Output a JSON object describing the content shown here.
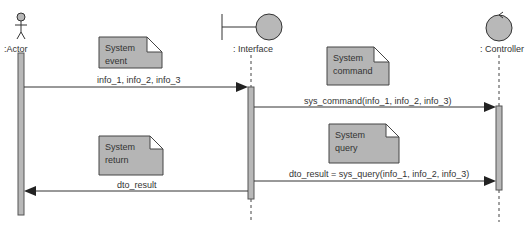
{
  "diagram": {
    "type": "sequence",
    "lifelines": [
      {
        "name": ":Actor",
        "stereotype": "actor"
      },
      {
        "name": ": Interface",
        "stereotype": "boundary"
      },
      {
        "name": ": Controller",
        "stereotype": "control"
      }
    ],
    "messages": [
      {
        "from": ":Actor",
        "to": ": Interface",
        "label": "info_1, info_2, info_3"
      },
      {
        "from": ": Interface",
        "to": ": Controller",
        "label": "sys_command(info_1, info_2, info_3)"
      },
      {
        "from": ": Interface",
        "to": ": Controller",
        "label": "dto_result = sys_query(info_1, info_2, info_3)"
      },
      {
        "from": ": Interface",
        "to": ":Actor",
        "label": "dto_result"
      }
    ],
    "notes": [
      {
        "line1": "System",
        "line2": "event"
      },
      {
        "line1": "System",
        "line2": "command"
      },
      {
        "line1": "System",
        "line2": "query"
      },
      {
        "line1": "System",
        "line2": "return"
      }
    ],
    "colors": {
      "fill": "#b8b8b8",
      "stroke": "#333333",
      "note_fill": "#b5b5b5"
    }
  }
}
